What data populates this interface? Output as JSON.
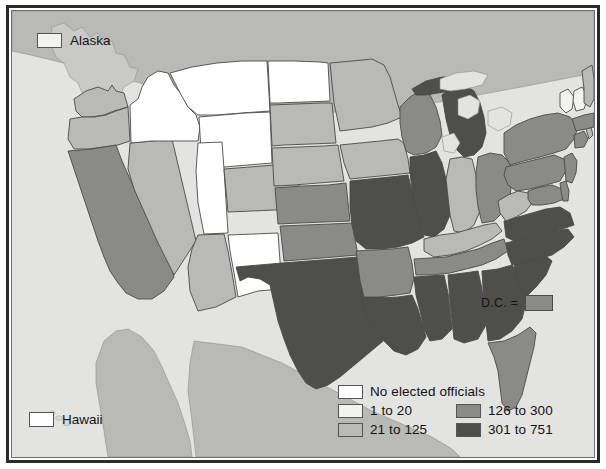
{
  "map": {
    "title": "United States elected officials choropleth map",
    "background_color": "#e3e3e1",
    "ocean_color": "#e3e3e1",
    "foreign_land_color": "#b9b9b7",
    "border_color": "#2a2a2a",
    "state_outline_color": "#4a4a4a"
  },
  "legend": {
    "columns": [
      {
        "id": "left",
        "entries": [
          {
            "label": "No elected officials",
            "color": "#ffffff",
            "swatch": "legend-swatch-none"
          },
          {
            "label": "1 to 20",
            "color": "#f2f2f0",
            "swatch": "legend-swatch-1-20"
          },
          {
            "label": "21 to 125",
            "color": "#b9b9b7",
            "swatch": "legend-swatch-21-125"
          }
        ]
      },
      {
        "id": "right",
        "entries": [
          {
            "label": "126 to 300",
            "color": "#8a8a88",
            "swatch": "legend-swatch-126-300"
          },
          {
            "label": "301 to 751",
            "color": "#4e4e4c",
            "swatch": "legend-swatch-301-751"
          }
        ]
      }
    ]
  },
  "insets": {
    "alaska": {
      "label": "Alaska",
      "color": "#f2f2f0",
      "category": "1 to 20"
    },
    "hawaii": {
      "label": "Hawaii",
      "color": "#ffffff",
      "category": "No elected officials"
    }
  },
  "dc": {
    "label": "D.C. =",
    "color": "#8a8a88",
    "category": "126 to 300"
  },
  "chart_data": {
    "type": "choropleth",
    "legend_position": "bottom-right",
    "bins": [
      {
        "label": "No elected officials",
        "min": 0,
        "max": 0,
        "color": "#ffffff"
      },
      {
        "label": "1 to 20",
        "min": 1,
        "max": 20,
        "color": "#f2f2f0"
      },
      {
        "label": "21 to 125",
        "min": 21,
        "max": 125,
        "color": "#b9b9b7"
      },
      {
        "label": "126 to 300",
        "min": 126,
        "max": 300,
        "color": "#8a8a88"
      },
      {
        "label": "301 to 751",
        "min": 301,
        "max": 751,
        "color": "#4e4e4c"
      }
    ],
    "states": [
      {
        "code": "WA",
        "name": "Washington",
        "bin": "21 to 125",
        "color": "#b9b9b7"
      },
      {
        "code": "OR",
        "name": "Oregon",
        "bin": "21 to 125",
        "color": "#b9b9b7"
      },
      {
        "code": "CA",
        "name": "California",
        "bin": "126 to 300",
        "color": "#8a8a88"
      },
      {
        "code": "NV",
        "name": "Nevada",
        "bin": "21 to 125",
        "color": "#b9b9b7"
      },
      {
        "code": "ID",
        "name": "Idaho",
        "bin": "No elected officials",
        "color": "#ffffff"
      },
      {
        "code": "MT",
        "name": "Montana",
        "bin": "No elected officials",
        "color": "#ffffff"
      },
      {
        "code": "WY",
        "name": "Wyoming",
        "bin": "No elected officials",
        "color": "#ffffff"
      },
      {
        "code": "UT",
        "name": "Utah",
        "bin": "No elected officials",
        "color": "#ffffff"
      },
      {
        "code": "AZ",
        "name": "Arizona",
        "bin": "21 to 125",
        "color": "#b9b9b7"
      },
      {
        "code": "CO",
        "name": "Colorado",
        "bin": "21 to 125",
        "color": "#b9b9b7"
      },
      {
        "code": "NM",
        "name": "New Mexico",
        "bin": "No elected officials",
        "color": "#ffffff"
      },
      {
        "code": "ND",
        "name": "North Dakota",
        "bin": "No elected officials",
        "color": "#ffffff"
      },
      {
        "code": "SD",
        "name": "South Dakota",
        "bin": "21 to 125",
        "color": "#b9b9b7"
      },
      {
        "code": "NE",
        "name": "Nebraska",
        "bin": "21 to 125",
        "color": "#b9b9b7"
      },
      {
        "code": "KS",
        "name": "Kansas",
        "bin": "126 to 300",
        "color": "#8a8a88"
      },
      {
        "code": "OK",
        "name": "Oklahoma",
        "bin": "126 to 300",
        "color": "#8a8a88"
      },
      {
        "code": "TX",
        "name": "Texas",
        "bin": "301 to 751",
        "color": "#4e4e4c"
      },
      {
        "code": "MN",
        "name": "Minnesota",
        "bin": "21 to 125",
        "color": "#b9b9b7"
      },
      {
        "code": "IA",
        "name": "Iowa",
        "bin": "21 to 125",
        "color": "#b9b9b7"
      },
      {
        "code": "MO",
        "name": "Missouri",
        "bin": "301 to 751",
        "color": "#4e4e4c"
      },
      {
        "code": "AR",
        "name": "Arkansas",
        "bin": "126 to 300",
        "color": "#8a8a88"
      },
      {
        "code": "LA",
        "name": "Louisiana",
        "bin": "301 to 751",
        "color": "#4e4e4c"
      },
      {
        "code": "WI",
        "name": "Wisconsin",
        "bin": "126 to 300",
        "color": "#8a8a88"
      },
      {
        "code": "IL",
        "name": "Illinois",
        "bin": "301 to 751",
        "color": "#4e4e4c"
      },
      {
        "code": "MI",
        "name": "Michigan",
        "bin": "301 to 751",
        "color": "#4e4e4c"
      },
      {
        "code": "IN",
        "name": "Indiana",
        "bin": "21 to 125",
        "color": "#b9b9b7"
      },
      {
        "code": "OH",
        "name": "Ohio",
        "bin": "126 to 300",
        "color": "#8a8a88"
      },
      {
        "code": "KY",
        "name": "Kentucky",
        "bin": "21 to 125",
        "color": "#b9b9b7"
      },
      {
        "code": "TN",
        "name": "Tennessee",
        "bin": "126 to 300",
        "color": "#8a8a88"
      },
      {
        "code": "MS",
        "name": "Mississippi",
        "bin": "301 to 751",
        "color": "#4e4e4c"
      },
      {
        "code": "AL",
        "name": "Alabama",
        "bin": "301 to 751",
        "color": "#4e4e4c"
      },
      {
        "code": "GA",
        "name": "Georgia",
        "bin": "301 to 751",
        "color": "#4e4e4c"
      },
      {
        "code": "FL",
        "name": "Florida",
        "bin": "126 to 300",
        "color": "#8a8a88"
      },
      {
        "code": "SC",
        "name": "South Carolina",
        "bin": "301 to 751",
        "color": "#4e4e4c"
      },
      {
        "code": "NC",
        "name": "North Carolina",
        "bin": "301 to 751",
        "color": "#4e4e4c"
      },
      {
        "code": "VA",
        "name": "Virginia",
        "bin": "301 to 751",
        "color": "#4e4e4c"
      },
      {
        "code": "WV",
        "name": "West Virginia",
        "bin": "21 to 125",
        "color": "#b9b9b7"
      },
      {
        "code": "MD",
        "name": "Maryland",
        "bin": "126 to 300",
        "color": "#8a8a88"
      },
      {
        "code": "DE",
        "name": "Delaware",
        "bin": "126 to 300",
        "color": "#8a8a88"
      },
      {
        "code": "PA",
        "name": "Pennsylvania",
        "bin": "126 to 300",
        "color": "#8a8a88"
      },
      {
        "code": "NJ",
        "name": "New Jersey",
        "bin": "126 to 300",
        "color": "#8a8a88"
      },
      {
        "code": "NY",
        "name": "New York",
        "bin": "126 to 300",
        "color": "#8a8a88"
      },
      {
        "code": "CT",
        "name": "Connecticut",
        "bin": "126 to 300",
        "color": "#8a8a88"
      },
      {
        "code": "RI",
        "name": "Rhode Island",
        "bin": "21 to 125",
        "color": "#b9b9b7"
      },
      {
        "code": "MA",
        "name": "Massachusetts",
        "bin": "126 to 300",
        "color": "#8a8a88"
      },
      {
        "code": "VT",
        "name": "Vermont",
        "bin": "1 to 20",
        "color": "#f2f2f0"
      },
      {
        "code": "NH",
        "name": "New Hampshire",
        "bin": "1 to 20",
        "color": "#f2f2f0"
      },
      {
        "code": "ME",
        "name": "Maine",
        "bin": "21 to 125",
        "color": "#b9b9b7"
      },
      {
        "code": "AK",
        "name": "Alaska",
        "bin": "1 to 20",
        "color": "#f2f2f0"
      },
      {
        "code": "HI",
        "name": "Hawaii",
        "bin": "No elected officials",
        "color": "#ffffff"
      },
      {
        "code": "DC",
        "name": "District of Columbia",
        "bin": "126 to 300",
        "color": "#8a8a88"
      }
    ]
  }
}
